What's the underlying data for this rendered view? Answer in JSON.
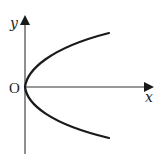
{
  "diagram": {
    "type": "coordinate-graph",
    "axes": {
      "x_label": "x",
      "y_label": "y",
      "origin_label": "O"
    },
    "curve": {
      "name": "parabola",
      "vertex": [
        0,
        0
      ],
      "opens": "right",
      "color": "#1a1a1a"
    },
    "colors": {
      "axis": "#333333",
      "curve": "#1a1a1a",
      "background": "#ffffff"
    }
  }
}
